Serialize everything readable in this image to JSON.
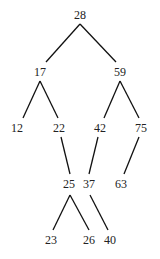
{
  "diagram": {
    "type": "binary-tree",
    "nodes": [
      {
        "id": "n28",
        "label": "28",
        "x": 80,
        "y": 16
      },
      {
        "id": "n17",
        "label": "17",
        "x": 40,
        "y": 73
      },
      {
        "id": "n59",
        "label": "59",
        "x": 120,
        "y": 73
      },
      {
        "id": "n12",
        "label": "12",
        "x": 17,
        "y": 129
      },
      {
        "id": "n22",
        "label": "22",
        "x": 59,
        "y": 129
      },
      {
        "id": "n42",
        "label": "42",
        "x": 100,
        "y": 129
      },
      {
        "id": "n75",
        "label": "75",
        "x": 141,
        "y": 129
      },
      {
        "id": "n25",
        "label": "25",
        "x": 69,
        "y": 185
      },
      {
        "id": "n37",
        "label": "37",
        "x": 89,
        "y": 185
      },
      {
        "id": "n63",
        "label": "63",
        "x": 121,
        "y": 185
      },
      {
        "id": "n23",
        "label": "23",
        "x": 51,
        "y": 241
      },
      {
        "id": "n26",
        "label": "26",
        "x": 89,
        "y": 241
      },
      {
        "id": "n40",
        "label": "40",
        "x": 110,
        "y": 241
      }
    ],
    "edges": [
      {
        "from": "n28",
        "to": "n17",
        "x1": 80,
        "y1": 24,
        "x2": 46,
        "y2": 62
      },
      {
        "from": "n28",
        "to": "n59",
        "x1": 80,
        "y1": 24,
        "x2": 116,
        "y2": 62
      },
      {
        "from": "n17",
        "to": "n12",
        "x1": 40,
        "y1": 81,
        "x2": 23,
        "y2": 118
      },
      {
        "from": "n17",
        "to": "n22",
        "x1": 40,
        "y1": 81,
        "x2": 58,
        "y2": 118
      },
      {
        "from": "n59",
        "to": "n42",
        "x1": 120,
        "y1": 81,
        "x2": 104,
        "y2": 118
      },
      {
        "from": "n59",
        "to": "n75",
        "x1": 120,
        "y1": 81,
        "x2": 139,
        "y2": 118
      },
      {
        "from": "n22",
        "to": "n25",
        "x1": 61,
        "y1": 137,
        "x2": 70,
        "y2": 174
      },
      {
        "from": "n42",
        "to": "n37",
        "x1": 98,
        "y1": 137,
        "x2": 89,
        "y2": 174
      },
      {
        "from": "n75",
        "to": "n63",
        "x1": 139,
        "y1": 137,
        "x2": 124,
        "y2": 174
      },
      {
        "from": "n25",
        "to": "n23",
        "x1": 70,
        "y1": 195,
        "x2": 53,
        "y2": 230
      },
      {
        "from": "n25",
        "to": "n26",
        "x1": 70,
        "y1": 195,
        "x2": 89,
        "y2": 230
      },
      {
        "from": "n37",
        "to": "n40",
        "x1": 90,
        "y1": 195,
        "x2": 108,
        "y2": 230
      }
    ]
  }
}
